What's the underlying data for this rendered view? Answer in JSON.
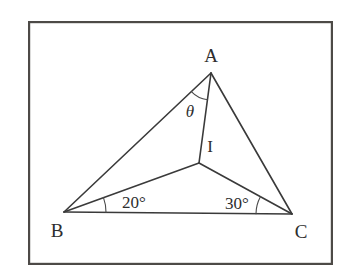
{
  "figure": {
    "type": "geometry-diagram",
    "frame": {
      "x": 28,
      "y": 21,
      "width": 305,
      "height": 244,
      "stroke_color": "#4d4a47"
    },
    "line_color": "#3a3a3a",
    "background_color": "#ffffff",
    "points": [
      {
        "id": "A",
        "label": "A",
        "x": 211,
        "y": 73,
        "label_x": 211,
        "label_y": 55
      },
      {
        "id": "B",
        "label": "B",
        "x": 64,
        "y": 212,
        "label_x": 57,
        "label_y": 230
      },
      {
        "id": "C",
        "label": "C",
        "x": 292,
        "y": 214,
        "label_x": 301,
        "label_y": 231
      },
      {
        "id": "I",
        "label": "I",
        "x": 199,
        "y": 163,
        "label_x": 210,
        "label_y": 146
      }
    ],
    "segments": [
      {
        "from": "A",
        "to": "B"
      },
      {
        "from": "A",
        "to": "C"
      },
      {
        "from": "B",
        "to": "C"
      },
      {
        "from": "A",
        "to": "I"
      },
      {
        "from": "B",
        "to": "I"
      },
      {
        "from": "C",
        "to": "I"
      }
    ],
    "angle_marks": [
      {
        "id": "angle-theta",
        "vertex": "A",
        "label": "θ",
        "label_x": 190,
        "label_y": 111
      },
      {
        "id": "angle-b",
        "vertex": "B",
        "label": "20°",
        "label_x": 134,
        "label_y": 202
      },
      {
        "id": "angle-c",
        "vertex": "C",
        "label": "30°",
        "label_x": 237,
        "label_y": 203
      }
    ]
  }
}
